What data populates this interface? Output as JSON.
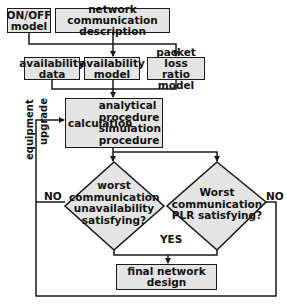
{
  "diagram": {
    "type": "flowchart",
    "colors": {
      "box_fill": "#e4e4e4",
      "stroke": "#1a1a1a",
      "text": "#111111",
      "background": "#ffffff"
    },
    "inputs": {
      "onoff_model": {
        "line1": "ON/OFF",
        "line2": "model"
      },
      "network_description": {
        "line1": "network communication",
        "line2": "description"
      }
    },
    "models": {
      "availability_data": {
        "line1": "availability",
        "line2": "data"
      },
      "availability_model": {
        "line1": "availability",
        "line2": "model"
      },
      "plr_model": {
        "line1": "packet loss",
        "line2": "ratio model"
      }
    },
    "calculation": {
      "label": "calculation",
      "methods": [
        "analytical",
        "procedure",
        "simulation",
        "procedure"
      ]
    },
    "decisions": {
      "unavailability": {
        "lines": [
          "worst",
          "communication",
          "unavailability",
          "satisfying?"
        ]
      },
      "plr": {
        "lines": [
          "Worst",
          "communication",
          "PLR satisfying?"
        ]
      }
    },
    "labels": {
      "no_left": "NO",
      "no_right": "NO",
      "yes": "YES",
      "feedback_line1": "equipment",
      "feedback_line2": "upgrade"
    },
    "output": {
      "label": "final network design"
    }
  }
}
